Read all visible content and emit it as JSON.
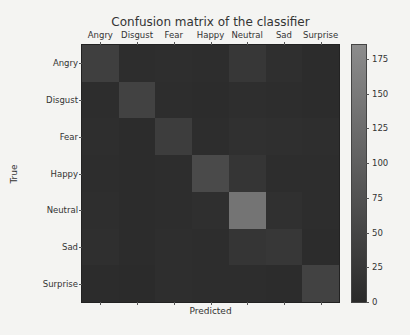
{
  "chart_data": {
    "type": "heatmap",
    "title": "Confusion matrix of the classifier",
    "xlabel": "Predicted",
    "ylabel": "True",
    "x_categories": [
      "Angry",
      "Disgust",
      "Fear",
      "Happy",
      "Neutral",
      "Sad",
      "Surprise"
    ],
    "y_categories": [
      "Angry",
      "Disgust",
      "Fear",
      "Happy",
      "Neutral",
      "Sad",
      "Surprise"
    ],
    "x_tick_position": "top",
    "values": [
      [
        40,
        5,
        8,
        6,
        25,
        10,
        4
      ],
      [
        6,
        45,
        5,
        4,
        8,
        6,
        3
      ],
      [
        8,
        4,
        35,
        5,
        12,
        10,
        8
      ],
      [
        5,
        3,
        5,
        60,
        20,
        6,
        5
      ],
      [
        8,
        3,
        6,
        10,
        140,
        12,
        5
      ],
      [
        10,
        4,
        8,
        6,
        20,
        25,
        4
      ],
      [
        4,
        2,
        8,
        5,
        6,
        3,
        45
      ]
    ],
    "colorbar": {
      "min": 0,
      "max": 185,
      "ticks": [
        0,
        25,
        50,
        75,
        100,
        125,
        150,
        175
      ],
      "color_low": "#2a2a2a",
      "color_high": "#8c8c8c"
    },
    "grid": false,
    "legend": "none"
  }
}
